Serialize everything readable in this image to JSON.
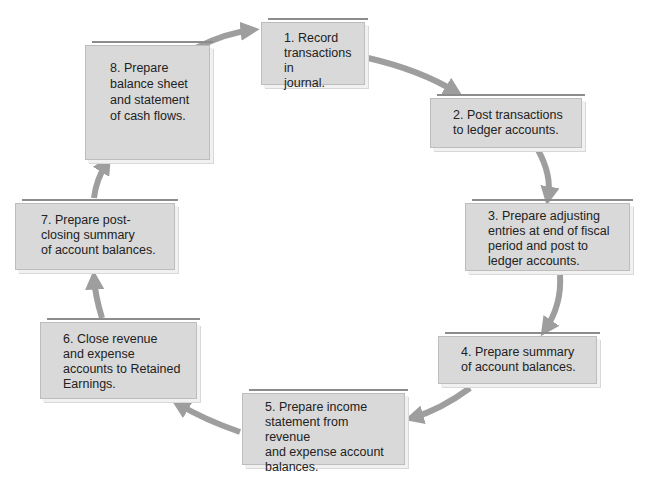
{
  "diagram": {
    "type": "cycle",
    "caption_partial": "... the steps of the accounting cycle",
    "colors": {
      "box_fill": "#d9d9d9",
      "box_border": "#bdbdbd",
      "arrow": "#9e9e9e",
      "text": "#222222"
    },
    "steps": [
      {
        "number": "1",
        "lines": [
          "1. Record",
          "transactions in",
          "journal."
        ]
      },
      {
        "number": "2",
        "lines": [
          "2. Post transactions",
          "to ledger accounts."
        ]
      },
      {
        "number": "3",
        "lines": [
          "3. Prepare adjusting",
          "entries at end of fiscal",
          "period and post to",
          "ledger accounts."
        ]
      },
      {
        "number": "4",
        "lines": [
          "4. Prepare summary",
          "of account balances."
        ]
      },
      {
        "number": "5",
        "lines": [
          "5. Prepare income",
          "statement from revenue",
          "and expense account",
          "balances."
        ]
      },
      {
        "number": "6",
        "lines": [
          "6. Close revenue",
          "and expense",
          "accounts to Retained",
          "Earnings."
        ]
      },
      {
        "number": "7",
        "lines": [
          "7. Prepare post-",
          "closing summary",
          "of account balances."
        ]
      },
      {
        "number": "8",
        "lines": [
          "8. Prepare",
          "balance sheet",
          "and statement",
          "of cash flows."
        ]
      }
    ],
    "edges": [
      {
        "from": "1",
        "to": "2"
      },
      {
        "from": "2",
        "to": "3"
      },
      {
        "from": "3",
        "to": "4"
      },
      {
        "from": "4",
        "to": "5"
      },
      {
        "from": "5",
        "to": "6"
      },
      {
        "from": "6",
        "to": "7"
      },
      {
        "from": "7",
        "to": "8"
      },
      {
        "from": "8",
        "to": "1"
      }
    ]
  }
}
